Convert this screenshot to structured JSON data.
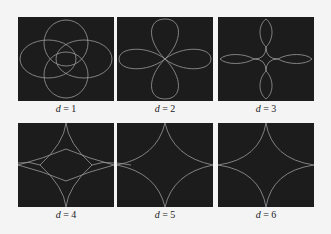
{
  "figure": {
    "background": "#f4f4f4",
    "panel_color": "#1c1c1c",
    "curve_color": "#9a9a9a",
    "panels": [
      {
        "label_var": "d",
        "label_eq": " = ",
        "label_val": "1"
      },
      {
        "label_var": "d",
        "label_eq": " = ",
        "label_val": "2"
      },
      {
        "label_var": "d",
        "label_eq": " = ",
        "label_val": "3"
      },
      {
        "label_var": "d",
        "label_eq": " = ",
        "label_val": "4"
      },
      {
        "label_var": "d",
        "label_eq": " = ",
        "label_val": "5"
      },
      {
        "label_var": "d",
        "label_eq": " = ",
        "label_val": "6"
      }
    ]
  }
}
